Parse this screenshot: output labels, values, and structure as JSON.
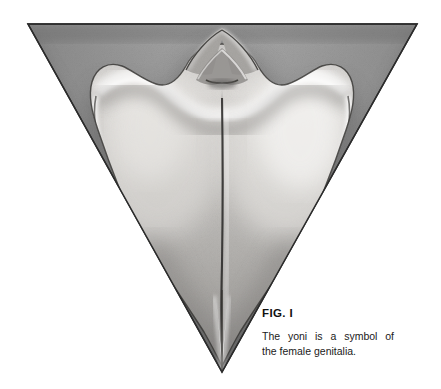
{
  "page": {
    "background_color": "#ffffff",
    "width": 441,
    "height": 389
  },
  "figure": {
    "label": "FIG. I",
    "caption_line_1": "The yoni is a symbol of",
    "caption_line_2": "the female genitalia.",
    "caption_full": "The yoni is a symbol of the female genitalia.",
    "medium": "graphite pencil drawing",
    "colors": {
      "paper": "#ffffff",
      "triangle_fill_light": "#b4b4b4",
      "triangle_fill_mid": "#9a9a9a",
      "triangle_fill_dark": "#6e6e6e",
      "outline": "#2b2b2b",
      "form_highlight": "#f2f0ee",
      "form_shadow": "#5c5c5c",
      "text": "#111111"
    },
    "geometry": {
      "triangle_top_left": [
        28,
        24
      ],
      "triangle_top_right": [
        417,
        24
      ],
      "triangle_apex": [
        222,
        372
      ],
      "center_axis_x": 222
    }
  }
}
